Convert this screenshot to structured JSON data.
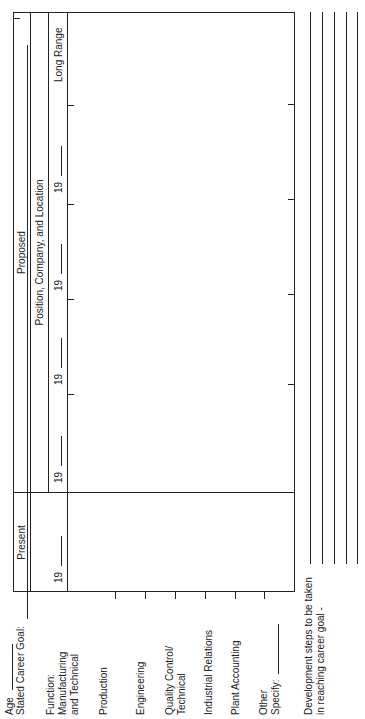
{
  "header": {
    "age_label": "Age",
    "career_goal_label": "Stated Career Goal:"
  },
  "functions": {
    "heading": "Function:",
    "items": [
      {
        "label": "Manufacturing",
        "label2": "and Technical"
      },
      {
        "label": "Production"
      },
      {
        "label": "Engineering"
      },
      {
        "label": "Quality Control/",
        "label2": "Technical"
      },
      {
        "label": "Industrial Relations"
      },
      {
        "label": "Plant Accounting"
      },
      {
        "label": "Other",
        "label2": "Specify:"
      }
    ]
  },
  "table": {
    "present_label": "Present",
    "proposed_label": "Proposed",
    "position_label": "Position, Company, and Location",
    "year_prefix": "19",
    "long_range_label": "Long Range"
  },
  "footer": {
    "development_line1": "Development steps to be taken",
    "development_line2": "in reaching career goal -"
  }
}
